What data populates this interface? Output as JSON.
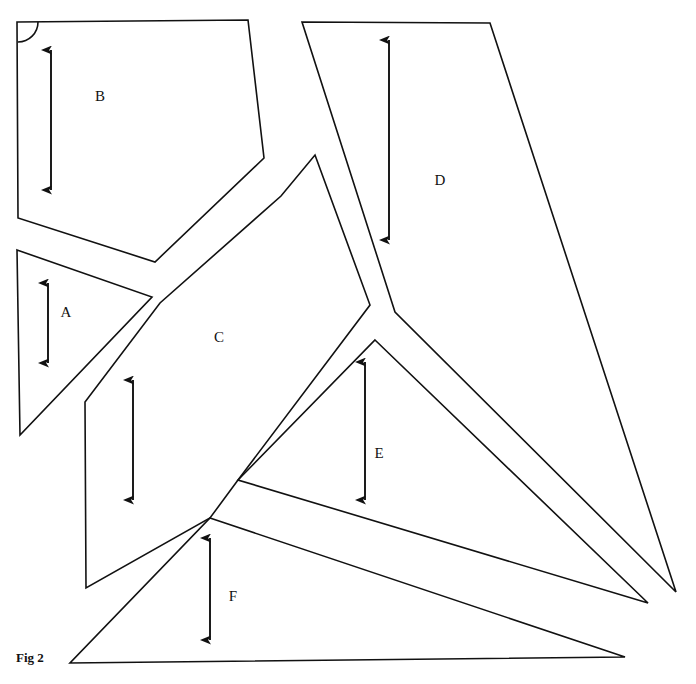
{
  "figure": {
    "caption": "Fig 2",
    "caption_position": {
      "x": 16,
      "y": 662
    },
    "background_color": "#ffffff",
    "stroke_color": "#111111",
    "width": 696,
    "height": 684
  },
  "shapes": [
    {
      "id": "shape-a",
      "label": "A",
      "label_position": {
        "x": 66,
        "y": 317
      },
      "points": "17,250 152,297 20,435",
      "closed": true,
      "sides": 3,
      "kind": "triangle"
    },
    {
      "id": "shape-b",
      "label": "B",
      "label_position": {
        "x": 100,
        "y": 101
      },
      "points": "17,22 248,20 264,158 155,262 18,218",
      "closed": true,
      "sides": 5,
      "kind": "pentagon"
    },
    {
      "id": "shape-c",
      "label": "C",
      "label_position": {
        "x": 219,
        "y": 342
      },
      "points": "315,155 370,305 238,480 210,518 86,588 85,402 160,303 281,196",
      "closed": true,
      "sides": 8,
      "kind": "polygon"
    },
    {
      "id": "shape-d",
      "label": "D",
      "label_position": {
        "x": 440,
        "y": 185
      },
      "points": "302,22 490,23 676,592 395,312",
      "closed": true,
      "sides": 4,
      "kind": "quadrilateral"
    },
    {
      "id": "shape-e",
      "label": "E",
      "label_position": {
        "x": 379,
        "y": 458
      },
      "points": "375,340 648,603 238,480",
      "closed": true,
      "sides": 3,
      "kind": "triangle"
    },
    {
      "id": "shape-f",
      "label": "F",
      "label_position": {
        "x": 233,
        "y": 601
      },
      "points": "210,518 625,657 70,663",
      "closed": true,
      "sides": 3,
      "kind": "triangle"
    }
  ],
  "angle_markers": [
    {
      "id": "right-angle-b",
      "on_shape": "B",
      "corner": {
        "x": 18,
        "y": 22
      },
      "radius": 20,
      "type": "right-angle-arc"
    }
  ],
  "dimension_arrows": [
    {
      "id": "arrow-a",
      "for_shape": "A",
      "x": 48,
      "y1": 283,
      "y2": 363,
      "heads": "both"
    },
    {
      "id": "arrow-b",
      "for_shape": "B",
      "x": 51,
      "y1": 50,
      "y2": 190,
      "heads": "both"
    },
    {
      "id": "arrow-c",
      "for_shape": "C",
      "x": 133,
      "y1": 380,
      "y2": 500,
      "heads": "both"
    },
    {
      "id": "arrow-d",
      "for_shape": "D",
      "x": 389,
      "y1": 40,
      "y2": 240,
      "heads": "both"
    },
    {
      "id": "arrow-e",
      "for_shape": "E",
      "x": 365,
      "y1": 362,
      "y2": 500,
      "heads": "both"
    },
    {
      "id": "arrow-f",
      "for_shape": "F",
      "x": 210,
      "y1": 538,
      "y2": 640,
      "heads": "both"
    }
  ]
}
